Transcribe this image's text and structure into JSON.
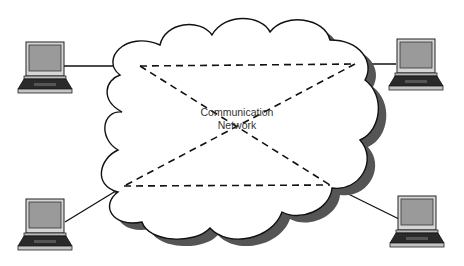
{
  "diagram": {
    "type": "network-topology",
    "cloud": {
      "label_line1": "Communication",
      "label_line2": "Network"
    },
    "nodes": [
      {
        "id": "laptop-top-left",
        "icon": "laptop-icon"
      },
      {
        "id": "laptop-top-right",
        "icon": "laptop-icon"
      },
      {
        "id": "laptop-bottom-left",
        "icon": "laptop-icon"
      },
      {
        "id": "laptop-bottom-right",
        "icon": "laptop-icon"
      }
    ],
    "links": {
      "solid": [
        "laptop-top-left",
        "laptop-top-right",
        "laptop-bottom-left",
        "laptop-bottom-right"
      ],
      "dashed_mesh": "full mesh between 4 access points (rectangle + 2 diagonals)"
    },
    "colors": {
      "stroke": "#111111",
      "shadow": "#555555",
      "screen": "#9a9a9a",
      "laptop_body": "#cfcfcf"
    }
  }
}
